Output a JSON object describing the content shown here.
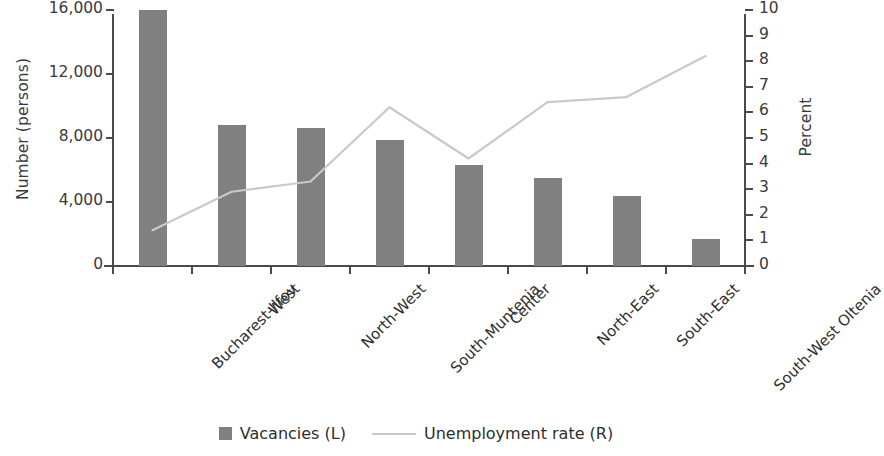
{
  "chart_data": {
    "type": "bar",
    "title": "",
    "subtitle": "",
    "categories": [
      "Bucharest-Ilfov",
      "West",
      "North-West",
      "South-Muntenia",
      "Center",
      "North-East",
      "South-East",
      "South-West Oltenia"
    ],
    "series": [
      {
        "name": "Vacancies (L)",
        "type": "bar",
        "axis": "left",
        "color": "#808080",
        "values": [
          16000,
          8800,
          8600,
          7900,
          6300,
          5500,
          4400,
          1700
        ]
      },
      {
        "name": "Unemployment rate (R)",
        "type": "line",
        "axis": "right",
        "color": "#c9c9c9",
        "values": [
          1.4,
          2.9,
          3.3,
          6.2,
          4.2,
          6.4,
          6.6,
          8.2
        ]
      }
    ],
    "xlabel": "",
    "ylabel": "Number (persons)",
    "y2label": "Percent",
    "ylim": [
      0,
      16000
    ],
    "y2lim": [
      0,
      10
    ],
    "yticks": [
      0,
      4000,
      8000,
      12000,
      16000
    ],
    "ytick_labels": [
      "0",
      "4,000",
      "8,000",
      "12,000",
      "16,000"
    ],
    "y2ticks": [
      0,
      1,
      2,
      3,
      4,
      5,
      6,
      7,
      8,
      9,
      10
    ],
    "y2tick_labels": [
      "0",
      "1",
      "2",
      "3",
      "4",
      "5",
      "6",
      "7",
      "8",
      "9",
      "10"
    ],
    "grid": false,
    "legend_position": "bottom"
  },
  "legend": {
    "bar_label": "Vacancies (L)",
    "line_label": "Unemployment rate (R)",
    "bar_swatch_icon": "square-swatch-icon",
    "line_swatch_icon": "line-swatch-icon"
  }
}
